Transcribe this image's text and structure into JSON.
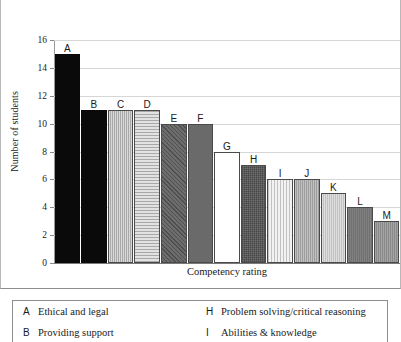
{
  "chart_data": {
    "type": "bar",
    "title": "",
    "xlabel": "Competency rating",
    "ylabel": "Number of students",
    "categories": [
      "A",
      "B",
      "C",
      "D",
      "E",
      "F",
      "G",
      "H",
      "I",
      "J",
      "K",
      "L",
      "M"
    ],
    "values": [
      15,
      11,
      11,
      11,
      10,
      10,
      8,
      7,
      6,
      6,
      5,
      4,
      3
    ],
    "ylim": [
      0,
      16
    ],
    "ytick_labels": [
      "0",
      "2",
      "4",
      "6",
      "8",
      "10",
      "12",
      "14",
      "16"
    ],
    "ytick_values": [
      0,
      2,
      4,
      6,
      8,
      10,
      12,
      14,
      16
    ],
    "grid": true,
    "legend_position": "below-plot",
    "bar_fills": [
      "solid-black",
      "solid-black",
      "vert-gray",
      "horiz-light",
      "diag-dark",
      "solid-dark",
      "white",
      "cross-dark",
      "vert-pale",
      "med-gray",
      "light-gray",
      "dark-gray2",
      "mid-dark"
    ]
  },
  "legend": {
    "rows": [
      {
        "left_key": "A",
        "left_text": "Ethical and legal",
        "right_key": "H",
        "right_text": "Problem solving/critical reasoning"
      },
      {
        "left_key": "B",
        "left_text": "Providing support",
        "right_key": "I",
        "right_text": "Abilities & knowledge"
      }
    ]
  }
}
